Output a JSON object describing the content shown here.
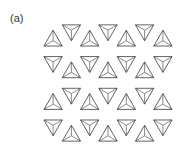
{
  "figure": {
    "panel_label": "(a)",
    "line_color": "#3a3a3a",
    "background": "#ffffff"
  }
}
